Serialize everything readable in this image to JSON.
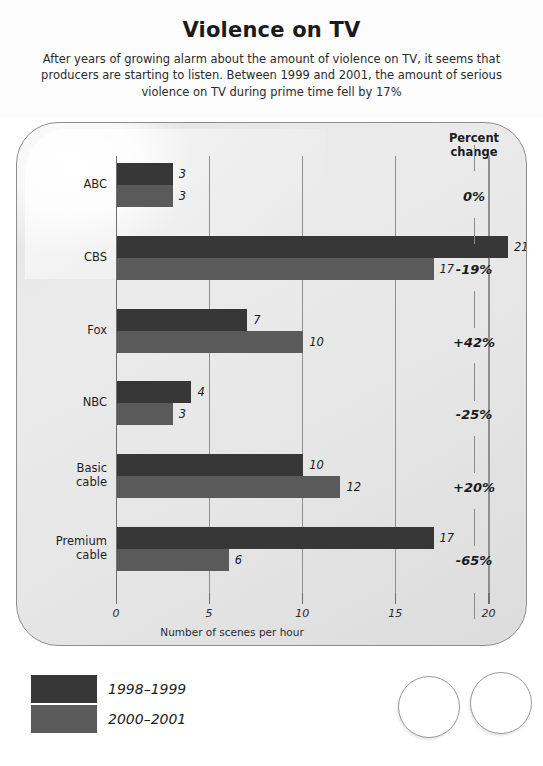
{
  "header": {
    "title": "Violence on TV",
    "subtitle": "After years of growing alarm about the amount of violence on TV, it seems that producers are starting to listen. Between 1999 and 2001, the amount of serious violence on TV during prime time fell by 17%"
  },
  "percent_column": {
    "header_line1": "Percent",
    "header_line2": "change"
  },
  "legend": {
    "items": [
      {
        "label": "1998–1999",
        "color": "#373737"
      },
      {
        "label": "2000–2001",
        "color": "#5a5a5a"
      }
    ]
  },
  "chart_data": {
    "type": "bar",
    "orientation": "horizontal",
    "title": "Violence on TV",
    "subtitle": "After years of growing alarm about the amount of violence on TV, it seems that producers are starting to listen. Between 1999 and 2001, the amount of serious violence on TV during prime time fell by 17%",
    "xlabel": "Number of scenes per hour",
    "ylabel": "",
    "xlim": [
      0,
      22
    ],
    "xticks": [
      0,
      5,
      10,
      15,
      20
    ],
    "xtick_labels": [
      "0",
      "5",
      "10",
      "15",
      "20"
    ],
    "grid": "vertical",
    "legend_position": "below-left",
    "categories": [
      "ABC",
      "CBS",
      "Fox",
      "NBC",
      "Basic cable",
      "Premium cable"
    ],
    "category_labels": [
      [
        "ABC"
      ],
      [
        "CBS"
      ],
      [
        "Fox"
      ],
      [
        "NBC"
      ],
      [
        "Basic",
        "cable"
      ],
      [
        "Premium",
        "cable"
      ]
    ],
    "series": [
      {
        "name": "1998–1999",
        "color": "#373737",
        "values": [
          3,
          21,
          7,
          4,
          10,
          17
        ]
      },
      {
        "name": "2000–2001",
        "color": "#5a5a5a",
        "values": [
          3,
          17,
          10,
          3,
          12,
          6
        ]
      }
    ],
    "annotations": {
      "percent_change_header": "Percent change",
      "percent_change": [
        "0%",
        "-19%",
        "+42%",
        "-25%",
        "+20%",
        "-65%"
      ]
    }
  }
}
